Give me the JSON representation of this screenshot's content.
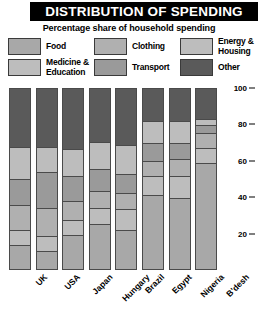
{
  "header": {
    "title": "DISTRIBUTION OF SPENDING",
    "subtitle": "Percentage share of household spending"
  },
  "legend": {
    "items": [
      {
        "label": "Food",
        "color": "#a8a8a8"
      },
      {
        "label": "Clothing",
        "color": "#b0b0b0"
      },
      {
        "label": "Energy &\nHousing",
        "color": "#bdbdbd"
      },
      {
        "label": "Medicine &\nEducation",
        "color": "#bdbdbd"
      },
      {
        "label": "Transport",
        "color": "#9a9a9a"
      },
      {
        "label": "Other",
        "color": "#5a5a5a"
      }
    ]
  },
  "chart_data": {
    "type": "bar",
    "subtype": "stacked-bar-100",
    "title": "DISTRIBUTION OF SPENDING",
    "subtitle": "Percentage share of household spending",
    "xlabel": "",
    "ylabel": "",
    "ylim": [
      0,
      100
    ],
    "yticks": [
      20,
      40,
      60,
      80,
      100
    ],
    "ytick_labels": [
      "20",
      "40",
      "60",
      "80",
      "100"
    ],
    "grid": false,
    "legend_position": "top",
    "categories": [
      "UK",
      "USA",
      "Japan",
      "Hungary",
      "Brazil",
      "Egypt",
      "Nigeria",
      "B'desh"
    ],
    "stack_order_bottom_to_top": [
      "Food",
      "Medicine & Education",
      "Clothing",
      "Transport",
      "Energy & Housing",
      "Other"
    ],
    "series": [
      {
        "name": "Food",
        "color": "#a8a8a8",
        "values": [
          13,
          10,
          19,
          25,
          22,
          42,
          40,
          60
        ]
      },
      {
        "name": "Medicine & Education",
        "color": "#bdbdbd",
        "values": [
          8,
          8,
          8,
          9,
          11,
          10,
          12,
          8
        ]
      },
      {
        "name": "Clothing",
        "color": "#b0b0b0",
        "values": [
          14,
          15,
          10,
          9,
          9,
          8,
          9,
          8
        ]
      },
      {
        "name": "Transport",
        "color": "#9a9a9a",
        "values": [
          14,
          20,
          14,
          12,
          10,
          10,
          9,
          4
        ]
      },
      {
        "name": "Energy & Housing",
        "color": "#bdbdbd",
        "values": [
          18,
          14,
          15,
          15,
          16,
          12,
          12,
          3
        ]
      },
      {
        "name": "Other",
        "color": "#5a5a5a",
        "values": [
          33,
          33,
          34,
          30,
          32,
          18,
          18,
          17
        ]
      }
    ]
  }
}
